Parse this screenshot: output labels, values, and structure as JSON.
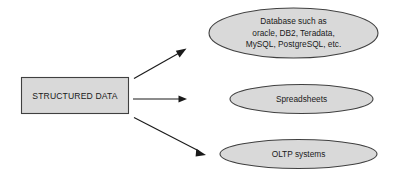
{
  "diagram": {
    "background_color": "#ffffff",
    "shape_fill_color": "#d9d9d9",
    "shape_stroke_color": "#404040",
    "text_color": "#1a1a1a",
    "arrow_color": "#1a1a1a",
    "source": {
      "icon_name": "rectangle-shape",
      "label": "STRUCTURED DATA"
    },
    "targets": [
      {
        "icon_name": "ellipse-shape",
        "label": "Database such as oracle, DB2, Teradata, MySQL, PostgreSQL, etc.",
        "lines": [
          "Database such as",
          "oracle, DB2, Teradata,",
          "MySQL, PostgreSQL, etc."
        ]
      },
      {
        "icon_name": "ellipse-shape",
        "label": "Spreadsheets",
        "lines": [
          "Spreadsheets"
        ]
      },
      {
        "icon_name": "ellipse-shape",
        "label": "OLTP systems",
        "lines": [
          "OLTP systems"
        ]
      }
    ],
    "connectors": [
      {
        "icon_name": "arrow-up-right-icon",
        "from": "STRUCTURED DATA",
        "to": "Database such as oracle, DB2, Teradata, MySQL, PostgreSQL, etc."
      },
      {
        "icon_name": "arrow-right-icon",
        "from": "STRUCTURED DATA",
        "to": "Spreadsheets"
      },
      {
        "icon_name": "arrow-down-right-icon",
        "from": "STRUCTURED DATA",
        "to": "OLTP systems"
      }
    ]
  }
}
